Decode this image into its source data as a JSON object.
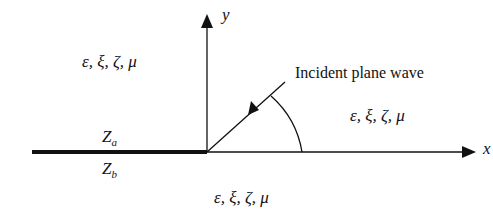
{
  "diagram": {
    "axes": {
      "x_label": "x",
      "y_label": "y"
    },
    "regions": {
      "upper_left": "ε, ξ, ζ, μ",
      "upper_right": "ε, ξ, ζ, μ",
      "lower": "ε, ξ, ζ, μ"
    },
    "impedance": {
      "upper_symbol": "Z",
      "upper_sub": "a",
      "lower_symbol": "Z",
      "lower_sub": "b"
    },
    "annotation": "Incident plane wave",
    "colors": {
      "line": "#111111",
      "background": "#ffffff"
    }
  }
}
